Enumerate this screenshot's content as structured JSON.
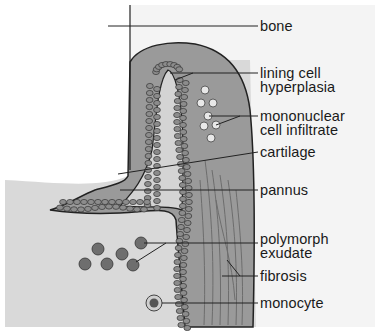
{
  "diagram": {
    "colors": {
      "background": "#ffffff",
      "bone_area": "#f2f2f2",
      "cartilage_field": "#d9d9d9",
      "synovium": "#9a9a9a",
      "cell": "#8c8c8c",
      "outline": "#222222",
      "polymorph": "#6e6e6e",
      "label_text": "#1a1a1a"
    },
    "labels": [
      {
        "id": "bone",
        "lines": [
          "bone"
        ]
      },
      {
        "id": "lining-cell-hyperplasia",
        "lines": [
          "lining cell",
          "hyperplasia"
        ]
      },
      {
        "id": "mononuclear-cell-infiltrate",
        "lines": [
          "mononuclear",
          "cell infiltrate"
        ]
      },
      {
        "id": "cartilage",
        "lines": [
          "cartilage"
        ]
      },
      {
        "id": "pannus",
        "lines": [
          "pannus"
        ]
      },
      {
        "id": "polymorph-exudate",
        "lines": [
          "polymorph",
          "exudate"
        ]
      },
      {
        "id": "fibrosis",
        "lines": [
          "fibrosis"
        ]
      },
      {
        "id": "monocyte",
        "lines": [
          "monocyte"
        ]
      }
    ]
  }
}
